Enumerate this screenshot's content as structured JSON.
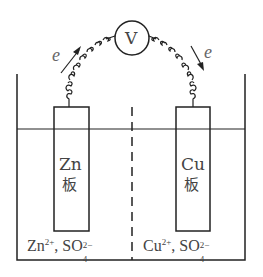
{
  "meter": {
    "label": "V"
  },
  "electron_label_left": "e",
  "electron_label_right": "e",
  "left_electrode": {
    "element": "Zn",
    "suffix": "板"
  },
  "right_electrode": {
    "element": "Cu",
    "suffix": "板"
  },
  "left_solution": {
    "cation": "Zn",
    "cation_charge": "2+",
    "separator": ",",
    "anion": "SO",
    "anion_sub": "4",
    "anion_charge": "2−"
  },
  "right_solution": {
    "cation": "Cu",
    "cation_charge": "2+",
    "separator": ",",
    "anion": "SO",
    "anion_sub": "4",
    "anion_charge": "2−"
  },
  "colors": {
    "line": "#222222",
    "text": "#444444"
  }
}
